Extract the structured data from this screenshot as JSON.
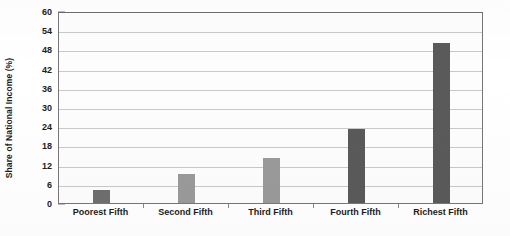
{
  "chart_data": {
    "type": "bar",
    "title": "",
    "xlabel": "",
    "ylabel": "Share of National Income (%)",
    "categories": [
      "Poorest Fifth",
      "Second Fifth",
      "Third Fifth",
      "Fourth Fifth",
      "Richest Fifth"
    ],
    "values": [
      4,
      9,
      14,
      23,
      50
    ],
    "bar_colors": [
      "#6e6e6e",
      "#9a9a9a",
      "#9a9a9a",
      "#5a5a5a",
      "#5a5a5a"
    ],
    "ylim": [
      0,
      60
    ],
    "ytick_labels": [
      "0",
      "6",
      "12",
      "18",
      "24",
      "30",
      "36",
      "42",
      "48",
      "54",
      "60"
    ],
    "ytick_values": [
      0,
      6,
      12,
      18,
      24,
      30,
      36,
      42,
      48,
      54,
      60
    ],
    "grid": true,
    "legend": "none"
  }
}
